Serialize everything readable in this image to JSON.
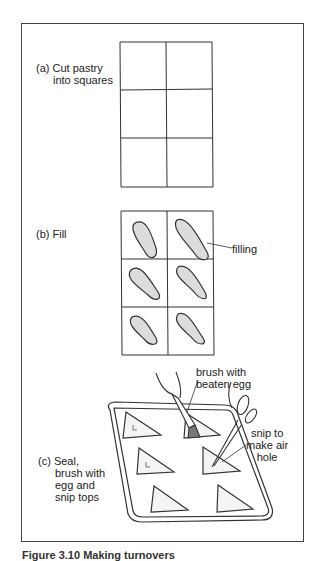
{
  "figure": {
    "steps": [
      {
        "id": "a",
        "label_line1": "(a) Cut pastry",
        "label_line2": "into squares"
      },
      {
        "id": "b",
        "label_line1": "(b) Fill"
      },
      {
        "id": "c",
        "label_line1": "(c) Seal,",
        "label_line2": "brush with",
        "label_line3": "egg and",
        "label_line4": "snip tops"
      }
    ],
    "annotations": {
      "filling": "filling",
      "brush_line1": "brush with",
      "brush_line2": "beaten egg",
      "snip_line1": "snip to",
      "snip_line2": "make air",
      "snip_line3": "hole"
    },
    "caption": "Figure 3.10  Making turnovers"
  }
}
